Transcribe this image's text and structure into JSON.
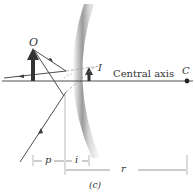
{
  "diagram": {
    "labels": {
      "object": "O",
      "image": "I",
      "center": "C",
      "axis": "Central axis",
      "object_distance": "p",
      "image_distance": "i",
      "radius": "r",
      "panel": "(c)"
    },
    "colors": {
      "line": "#3a3a3a",
      "mirror_dark": "#8a8a8a",
      "mirror_light": "#ffffff",
      "dashed": "#9a9a9a"
    }
  }
}
